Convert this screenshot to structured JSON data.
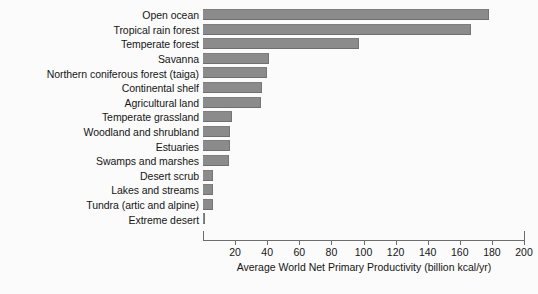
{
  "chart_data": {
    "type": "bar",
    "orientation": "horizontal",
    "title": "",
    "xlabel": "Average World Net Primary Productivity (billion kcal/yr)",
    "ylabel": "",
    "xlim": [
      0,
      200
    ],
    "xticks": [
      20,
      40,
      60,
      80,
      100,
      120,
      140,
      160,
      180,
      200
    ],
    "grid": false,
    "legend": null,
    "bar_color": "#8b8b8b",
    "background_color": "#fbfbfb",
    "categories": [
      "Open ocean",
      "Tropical rain forest",
      "Temperate forest",
      "Savanna",
      "Northern coniferous forest (taiga)",
      "Continental shelf",
      "Agricultural land",
      "Temperate grassland",
      "Woodland and shrubland",
      "Estuaries",
      "Swamps and marshes",
      "Desert scrub",
      "Lakes and streams",
      "Tundra (artic and alpine)",
      "Extreme desert"
    ],
    "values": [
      178,
      167,
      97,
      41,
      40,
      37,
      36,
      18,
      17,
      17,
      16,
      6,
      6,
      6,
      1.5
    ]
  },
  "axis": {
    "label": "Average World Net Primary Productivity (billion kcal/yr)",
    "ticks": [
      "20",
      "40",
      "60",
      "80",
      "100",
      "120",
      "140",
      "160",
      "180",
      "200"
    ]
  }
}
